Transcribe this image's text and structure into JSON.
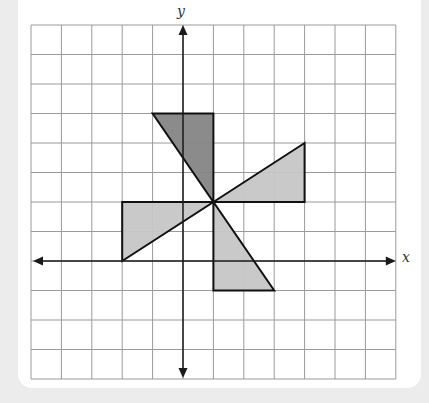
{
  "figure": {
    "type": "coordinate-grid-diagram",
    "grid": {
      "columns": 12,
      "rows": 12,
      "left_px": 31,
      "top_px": 25,
      "cell_w_px": 30.4,
      "cell_h_px": 29.5,
      "line_color": "#9a9a9a"
    },
    "axes": {
      "x_label": "x",
      "y_label": "y",
      "origin_col": 5,
      "origin_row": 8,
      "color": "#1a1a1a",
      "x_range": [
        -5,
        7
      ],
      "y_range": [
        -4,
        8
      ]
    },
    "colors": {
      "dark_fill": "#858585",
      "light_fill": "#c6c6c6",
      "stroke": "#111111",
      "background": "#ececec",
      "panel": "#ffffff"
    },
    "shapes": [
      {
        "name": "dark-triangle-top",
        "fill": "dark",
        "points": [
          [
            -1,
            5
          ],
          [
            1,
            5
          ],
          [
            1,
            2
          ]
        ]
      },
      {
        "name": "light-triangle-right",
        "fill": "light",
        "points": [
          [
            1,
            2
          ],
          [
            4,
            4
          ],
          [
            4,
            2
          ]
        ]
      },
      {
        "name": "light-triangle-left",
        "fill": "light",
        "points": [
          [
            -2,
            2
          ],
          [
            1,
            2
          ],
          [
            -2,
            0
          ]
        ]
      },
      {
        "name": "light-triangle-bottom",
        "fill": "light",
        "points": [
          [
            1,
            2
          ],
          [
            1,
            -1
          ],
          [
            3,
            -1
          ]
        ]
      }
    ],
    "center_of_rotation": [
      1,
      2
    ]
  }
}
